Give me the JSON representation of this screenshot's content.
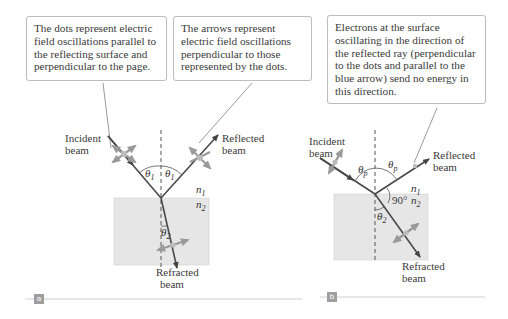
{
  "panel_a": {
    "callout_left": "The dots represent electric field oscillations parallel to the reflecting surface and perpendicular to the page.",
    "callout_right": "The arrows represent electric field oscillations perpendicular to those represented by the dots.",
    "incident_label_1": "Incident",
    "incident_label_2": "beam",
    "reflected_label_1": "Reflected",
    "reflected_label_2": "beam",
    "refracted_label_1": "Refracted",
    "refracted_label_2": "beam",
    "theta_incident": "θ",
    "theta_incident_sub": "1",
    "theta_reflected": "θ",
    "theta_reflected_sub": "1",
    "theta_refracted": "θ",
    "theta_refracted_sub": "2",
    "n1": "n",
    "n1_sub": "1",
    "n2": "n",
    "n2_sub": "2",
    "tag": "a"
  },
  "panel_b": {
    "callout": "Electrons at the surface oscillating in the direction of the reflected ray (perpendicular to the dots and parallel to the blue arrow) send no energy in this direction.",
    "incident_label_1": "Incident",
    "incident_label_2": "beam",
    "reflected_label_1": "Reflected",
    "reflected_label_2": "beam",
    "refracted_label_1": "Refracted",
    "refracted_label_2": "beam",
    "theta_incident": "θ",
    "theta_incident_sub": "p",
    "theta_reflected": "θ",
    "theta_reflected_sub": "p",
    "theta_refracted": "θ",
    "theta_refracted_sub": "2",
    "angle_90": "90°",
    "n1": "n",
    "n1_sub": "1",
    "n2": "n",
    "n2_sub": "2",
    "tag": "b"
  },
  "colors": {
    "medium_fill": "#e6e6e6",
    "ray": "#4a4a4a",
    "oscillation_arrow": "#9a9a9a",
    "normal_line": "#555555",
    "callout_border": "#bdbdbd",
    "tag_bg": "#9e9e9e"
  }
}
